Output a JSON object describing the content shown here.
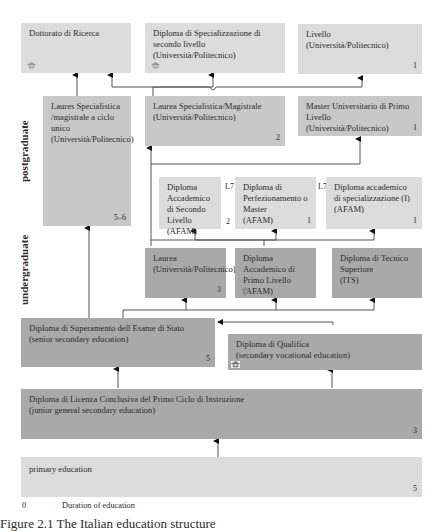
{
  "side_labels": {
    "postgraduate": "postgraduate",
    "undergraduate": "undergraduate"
  },
  "boxes": {
    "dottorato": {
      "title": "Dottorato di Ricerca",
      "icon": "graduation-cap-icon"
    },
    "spec_secondo": {
      "title": "Diploma di Specializzazione di secondo livello",
      "sub": "(Università/Politecnico)",
      "icon": "graduation-cap-icon"
    },
    "master_secondo": {
      "title": "Livello",
      "sub": "(Università/Politecnico)",
      "duration": "1"
    },
    "ciclo_unico": {
      "title": "Laures Specialistica /magistrale a ciclo unico",
      "sub": "(Università/Politecnico)",
      "duration": "5–6"
    },
    "magistrale": {
      "title": "Laurea Specialistica/Magistrale",
      "sub": "(Università/Politecnico)",
      "duration": "2"
    },
    "master_primo": {
      "title": "Master Universitario di Primo Livello",
      "sub": "(Università/Politecnico)",
      "duration": "1"
    },
    "afam_secondo": {
      "title": "Diploma Accademico di Secondo Livello",
      "sub": "(AFAM)",
      "duration": "2",
      "level": "L7"
    },
    "afam_perf": {
      "title": "Diploma di Perfezionamento o Master",
      "sub": "(AFAM)",
      "duration": "1",
      "level": "L7"
    },
    "afam_spec": {
      "title": "Diploma accademico di specializzazione (I)",
      "sub": "(AFAM)",
      "duration": "1"
    },
    "laurea": {
      "title": "Laurea",
      "sub": "(Università/Politecnico)",
      "duration": "3"
    },
    "afam_primo": {
      "title": "Diploma Accademico di Primo Livello",
      "sub": "(AFAM)",
      "icon": "graduation-cap-icon"
    },
    "its": {
      "title": "Diploma di Tecnico Superiore",
      "sub": "(ITS)"
    },
    "esame_stato": {
      "title": "Diploma di Superamento dell Esame di Stato",
      "sub": "(senior secondary education)",
      "duration": "5"
    },
    "qualifica": {
      "title": "Diploma di Qualifica",
      "sub": "(secondary vocational education)",
      "icon": "graduation-cap-icon"
    },
    "licenza": {
      "title": "Diploma di Licenza Conclusiva del Primo Ciclo di Instruzione",
      "sub": "(junior general secondary education)",
      "duration": "3"
    },
    "primary": {
      "title": "primary education",
      "duration": "5"
    }
  },
  "legend": {
    "symbol": "0",
    "label": "Duration of education"
  },
  "caption": "Figure 2.1 The Italian education structure"
}
